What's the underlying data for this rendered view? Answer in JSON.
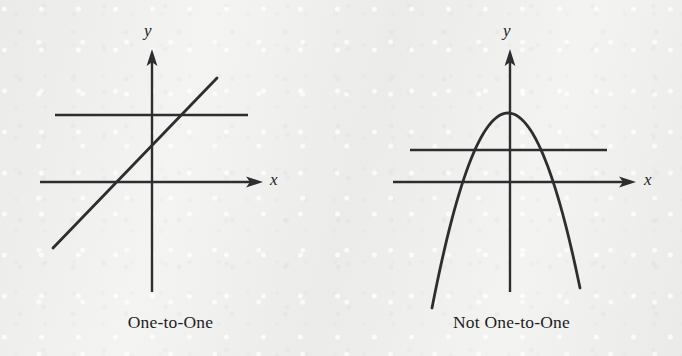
{
  "figure": {
    "background_color": "#efefed",
    "ink_color": "#2e2e30",
    "panels": [
      {
        "id": "one-to-one",
        "caption": "One-to-One",
        "x_axis_label": "x",
        "y_axis_label": "y",
        "curve_kind": "line"
      },
      {
        "id": "not-one-to-one",
        "caption": "Not One-to-One",
        "x_axis_label": "x",
        "y_axis_label": "y",
        "curve_kind": "parabola"
      }
    ]
  },
  "chart_data": [
    {
      "type": "line",
      "title": "One-to-One",
      "xlabel": "x",
      "ylabel": "y",
      "grid": false,
      "legend": "none",
      "axes": {
        "origin_px": [
          152,
          182
        ],
        "x_axis_from_px": [
          40,
          182
        ],
        "x_axis_to_px": [
          262,
          182
        ],
        "y_axis_from_px": [
          152,
          292
        ],
        "y_axis_to_px": [
          152,
          50
        ],
        "x_arrow": true,
        "y_arrow": true
      },
      "series": [
        {
          "name": "increasing-line",
          "kind": "line",
          "points_px": [
            [
              53,
              248
            ],
            [
              217,
              78
            ]
          ],
          "slope_px": -1.04,
          "description": "straight increasing line passing through the axes"
        },
        {
          "name": "horizontal-test-line",
          "kind": "horizontal-test-line",
          "points_px": [
            [
              55,
              115
            ],
            [
              248,
              115
            ]
          ],
          "intersections_with_curve": 1,
          "description": "horizontal line meets the graph exactly once"
        }
      ]
    },
    {
      "type": "line",
      "title": "Not One-to-One",
      "xlabel": "x",
      "ylabel": "y",
      "grid": false,
      "legend": "none",
      "axes": {
        "origin_px": [
          510,
          182
        ],
        "x_axis_from_px": [
          393,
          182
        ],
        "x_axis_to_px": [
          636,
          182
        ],
        "y_axis_from_px": [
          510,
          292
        ],
        "y_axis_to_px": [
          510,
          50
        ],
        "x_arrow": true,
        "y_arrow": true
      },
      "series": [
        {
          "name": "downward-parabola",
          "kind": "parabola",
          "vertex_px": [
            508,
            113
          ],
          "opens": "down",
          "endpoints_px": [
            [
              432,
              288
            ],
            [
              580,
              288
            ]
          ],
          "description": "downward opening parabola"
        },
        {
          "name": "horizontal-test-line",
          "kind": "horizontal-test-line",
          "points_px": [
            [
              410,
              150
            ],
            [
              607,
              150
            ]
          ],
          "intersections_with_curve": 2,
          "description": "horizontal line meets the graph twice"
        }
      ]
    }
  ]
}
